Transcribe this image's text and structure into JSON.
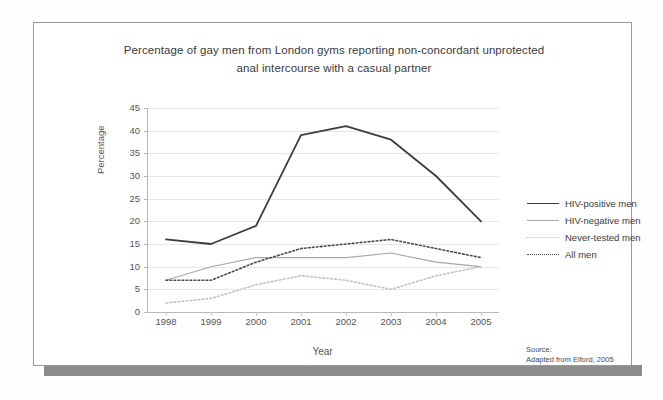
{
  "figure": {
    "title_line1": "Percentage of gay men from London gyms reporting non-concordant unprotected",
    "title_line2": "anal intercourse with a casual partner",
    "source_label": "Source:",
    "source_text": "Adapted from Elford, 2005"
  },
  "colors": {
    "hiv_positive": "#3d3d3d",
    "hiv_negative": "#a8a8a8",
    "never_tested": "#c3c3c3",
    "all_men": "#4a4a4a",
    "gridline": "#e6e6e6",
    "axis": "#b9b9b9",
    "frame": "#9a9a9a",
    "shadow_bar": "#8c8c8c"
  },
  "chart_data": {
    "type": "line",
    "title": "Percentage of gay men from London gyms reporting non-concordant unprotected anal intercourse with a casual partner",
    "xlabel": "Year",
    "ylabel": "Percentage",
    "categories": [
      "1998",
      "1999",
      "2000",
      "2001",
      "2002",
      "2003",
      "2004",
      "2005"
    ],
    "x": [
      1998,
      1999,
      2000,
      2001,
      2002,
      2003,
      2004,
      2005
    ],
    "ylim": [
      0,
      45
    ],
    "ytick_labels": [
      "0",
      "5",
      "10",
      "15",
      "20",
      "25",
      "30",
      "35",
      "40",
      "45"
    ],
    "yticks": [
      0,
      5,
      10,
      15,
      20,
      25,
      30,
      35,
      40,
      45
    ],
    "grid": true,
    "legend_position": "right",
    "series": [
      {
        "name": "HIV-positive men",
        "style": "solid",
        "width": 1.8,
        "color": "#3d3d3d",
        "values": [
          16,
          15,
          19,
          39,
          41,
          38,
          30,
          20
        ]
      },
      {
        "name": "HIV-negative men",
        "style": "solid",
        "width": 1.1,
        "color": "#a8a8a8",
        "values": [
          7,
          10,
          12,
          12,
          12,
          13,
          11,
          10
        ]
      },
      {
        "name": "Never-tested men",
        "style": "dotted",
        "width": 1.6,
        "color": "#c3c3c3",
        "values": [
          2,
          3,
          6,
          8,
          7,
          5,
          8,
          10
        ]
      },
      {
        "name": "All men",
        "style": "dotted",
        "width": 1.6,
        "color": "#4a4a4a",
        "values": [
          7,
          7,
          11,
          14,
          15,
          16,
          14,
          12
        ]
      }
    ]
  }
}
